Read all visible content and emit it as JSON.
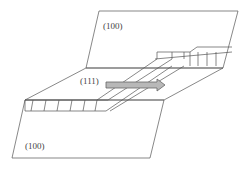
{
  "diagram": {
    "labels": {
      "top_plane": "(100)",
      "middle_plane": "(111)",
      "bottom_plane": "(100)"
    },
    "colors": {
      "line": "#555555",
      "arrow_fill": "#b8b8b8",
      "arrow_stroke": "#666666"
    },
    "arrow": {
      "direction": "right"
    }
  }
}
